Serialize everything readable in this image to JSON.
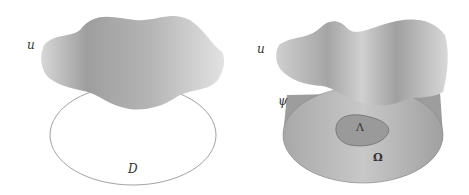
{
  "figure": {
    "left_panel": {
      "surface_label": "u",
      "domain_label": "D"
    },
    "right_panel": {
      "surface_label": "u",
      "obstacle_label": "ψ",
      "contact_set_label": "Λ",
      "domain_label": "Ω"
    },
    "colors": {
      "surface_fill": "#a9a9a9",
      "surface_light": "#d9d9d9",
      "domain_outline": "#8a8a8a",
      "cylinder_fill": "#b4b4b4",
      "contact_set_fill": "#999999"
    }
  }
}
